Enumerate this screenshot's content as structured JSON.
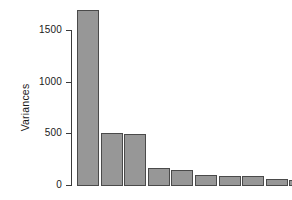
{
  "chart_data": {
    "type": "bar",
    "title": "",
    "subtitle": "",
    "xlabel": "",
    "ylabel": "Variances",
    "categories": [
      "1",
      "2",
      "3",
      "4",
      "5",
      "6",
      "7",
      "8",
      "9",
      "10"
    ],
    "values": [
      1690,
      505,
      495,
      165,
      145,
      97,
      88,
      85,
      58,
      50
    ],
    "series": [
      {
        "name": "Variances",
        "values": [
          1690,
          505,
          495,
          165,
          145,
          97,
          88,
          85,
          58,
          50
        ]
      }
    ],
    "ylim": [
      0,
      1740
    ],
    "yticks": [
      0,
      500,
      1000,
      1500
    ],
    "ytick_labels": [
      "0",
      "500",
      "1000",
      "1500"
    ],
    "xticks": [],
    "xtick_labels": [],
    "grid": false,
    "legend": false,
    "legend_position": "none",
    "bar_fill_color": "#979797",
    "bar_border_color": "#4a4a4a",
    "axis_color": "#3b3b3b",
    "text_color": "#1a1a1a",
    "background_color": "#ffffff",
    "annotations": []
  },
  "axis": {
    "y_title": "Variances"
  }
}
